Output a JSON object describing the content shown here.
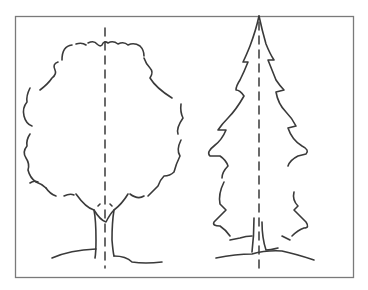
{
  "illustration": {
    "subject": "Two hand-drawn trees with dashed center axis lines",
    "trees": [
      {
        "name": "deciduous-tree",
        "center_x": 105
      },
      {
        "name": "conifer-tree",
        "center_x": 259
      }
    ],
    "colors": {
      "stroke": "#3a3a3a",
      "frame": "#7a7a7a",
      "background": "#ffffff"
    }
  }
}
